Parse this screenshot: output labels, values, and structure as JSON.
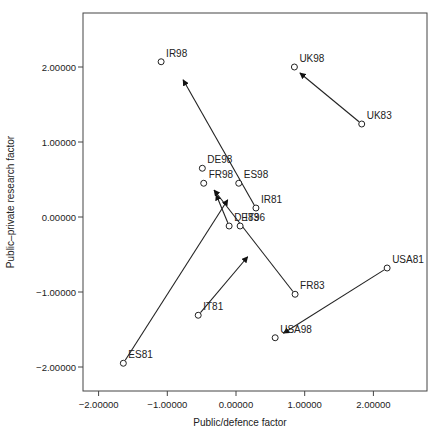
{
  "chart_data": {
    "type": "scatter",
    "title": "",
    "xlabel": "Public/defence factor",
    "ylabel": "Public–private research factor",
    "xlim": [
      -2.3,
      2.78
    ],
    "ylim": [
      -2.3,
      2.73
    ],
    "grid": false,
    "legend": null,
    "x_ticks": [
      -2,
      -1,
      0,
      1,
      2
    ],
    "x_tick_labels": [
      "−2.00000",
      "−1.00000",
      "0.00000",
      "1.00000",
      "2.00000"
    ],
    "y_ticks": [
      2,
      1,
      0,
      -1,
      -2
    ],
    "y_tick_labels": [
      "2.00000",
      "1.00000",
      "0.00000",
      "−1.00000",
      "−2.00000"
    ],
    "points": [
      {
        "label": "IR98",
        "x": -1.09,
        "y": 2.07
      },
      {
        "label": "UK98",
        "x": 0.85,
        "y": 2.0
      },
      {
        "label": "UK83",
        "x": 1.83,
        "y": 1.24
      },
      {
        "label": "DE98",
        "x": -0.49,
        "y": 0.65
      },
      {
        "label": "FR98",
        "x": -0.47,
        "y": 0.45
      },
      {
        "label": "ES98",
        "x": 0.04,
        "y": 0.45
      },
      {
        "label": "IR81",
        "x": 0.29,
        "y": 0.12
      },
      {
        "label": "DE83",
        "x": -0.1,
        "y": -0.12
      },
      {
        "label": "IT96",
        "x": 0.06,
        "y": -0.12
      },
      {
        "label": "FR83",
        "x": 0.86,
        "y": -1.03
      },
      {
        "label": "IT81",
        "x": -0.55,
        "y": -1.31
      },
      {
        "label": "USA81",
        "x": 2.2,
        "y": -0.68
      },
      {
        "label": "USA98",
        "x": 0.57,
        "y": -1.61
      },
      {
        "label": "ES81",
        "x": -1.64,
        "y": -1.95
      }
    ],
    "arrows": [
      {
        "from": "IR81",
        "x1": 0.29,
        "y1": 0.12,
        "x2": -0.77,
        "y2": 1.83
      },
      {
        "from": "UK83",
        "x1": 1.83,
        "y1": 1.24,
        "x2": 0.93,
        "y2": 1.92
      },
      {
        "from": "FR83",
        "x1": 0.86,
        "y1": -1.03,
        "x2": -0.32,
        "y2": 0.36
      },
      {
        "from": "ES81",
        "x1": -1.64,
        "y1": -1.95,
        "x2": -0.12,
        "y2": 0.23
      },
      {
        "from": "DE83",
        "x1": -0.1,
        "y1": -0.12,
        "x2": -0.29,
        "y2": 0.3
      },
      {
        "from": "IT81",
        "x1": -0.55,
        "y1": -1.31,
        "x2": 0.17,
        "y2": -0.53
      },
      {
        "from": "USA81",
        "x1": 2.2,
        "y1": -0.68,
        "x2": 0.69,
        "y2": -1.55
      }
    ]
  }
}
